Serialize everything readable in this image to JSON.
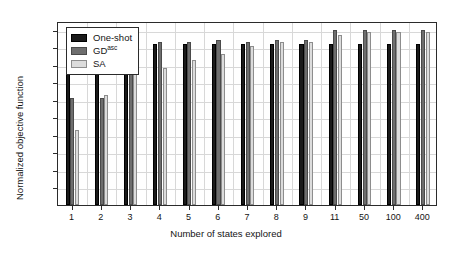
{
  "chart_data": {
    "type": "bar",
    "title": "",
    "xlabel": "Number of states explored",
    "ylabel": "Normalized objective function",
    "categories": [
      "1",
      "2",
      "3",
      "4",
      "5",
      "6",
      "7",
      "8",
      "9",
      "11",
      "50",
      "100",
      "400"
    ],
    "series": [
      {
        "name": "One-shot",
        "color": "#1a1a1a",
        "values": [
          0.92,
          0.92,
          0.92,
          0.92,
          0.92,
          0.92,
          0.92,
          0.92,
          0.92,
          0.92,
          0.92,
          0.92,
          0.92
        ]
      },
      {
        "name": "GDasc",
        "color": "#6e6e6e",
        "values": [
          0.61,
          0.61,
          0.79,
          0.93,
          0.93,
          0.94,
          0.93,
          0.94,
          0.94,
          1.0,
          1.0,
          1.0,
          1.0
        ]
      },
      {
        "name": "SA",
        "color": "#dcdcdc",
        "values": [
          0.43,
          0.63,
          0.76,
          0.78,
          0.83,
          0.86,
          0.91,
          0.93,
          0.93,
          0.97,
          0.99,
          0.99,
          0.99
        ]
      }
    ],
    "ylim": [
      0,
      1.05
    ],
    "yticks": [
      "0.1",
      "0.2",
      "0.3",
      "0.4",
      "0.5",
      "0.6",
      "0.7",
      "0.8",
      "0.9",
      "1"
    ],
    "ytick_values": [
      0.1,
      0.2,
      0.3,
      0.4,
      0.5,
      0.6,
      0.7,
      0.8,
      0.9,
      1.0
    ],
    "grid": true,
    "legend_position": "top-left"
  },
  "legend": {
    "entries": [
      {
        "label": "One-shot",
        "sup": ""
      },
      {
        "label": "GD",
        "sup": "asc"
      },
      {
        "label": "SA",
        "sup": ""
      }
    ]
  }
}
